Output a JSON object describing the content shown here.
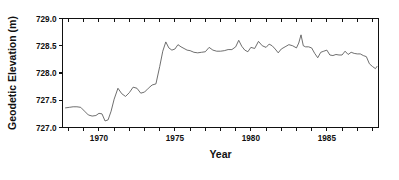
{
  "chart_data": {
    "type": "line",
    "title": "",
    "subtitle": "",
    "xlabel": "Year",
    "ylabel": "Geodetic Elevation (m)",
    "xlim": [
      1967.6,
      1988.4
    ],
    "ylim": [
      727.0,
      729.0
    ],
    "grid": false,
    "legend": null,
    "y_ticks": [
      {
        "value": 727.0,
        "label": "727.0"
      },
      {
        "value": 727.5,
        "label": "727.5"
      },
      {
        "value": 728.0,
        "label": "728.0"
      },
      {
        "value": 728.5,
        "label": "728.5"
      },
      {
        "value": 729.0,
        "label": "729.0"
      }
    ],
    "x_ticks_major": [
      {
        "value": 1970,
        "label": "1970"
      },
      {
        "value": 1975,
        "label": "1975"
      },
      {
        "value": 1980,
        "label": "1980"
      },
      {
        "value": 1985,
        "label": "1985"
      }
    ],
    "x_ticks_minor": [
      1968,
      1969,
      1971,
      1972,
      1973,
      1974,
      1976,
      1977,
      1978,
      1979,
      1981,
      1982,
      1983,
      1984,
      1986,
      1987,
      1988
    ],
    "line_color": "#555555",
    "axis_color": "#111111",
    "series": [
      {
        "name": "Geodetic Elevation",
        "x": [
          1967.8,
          1968.05,
          1968.3,
          1968.55,
          1968.8,
          1969.05,
          1969.3,
          1969.55,
          1969.8,
          1970.0,
          1970.2,
          1970.4,
          1970.6,
          1970.8,
          1971.0,
          1971.25,
          1971.5,
          1971.75,
          1972.0,
          1972.25,
          1972.5,
          1972.75,
          1973.0,
          1973.25,
          1973.5,
          1973.75,
          1974.0,
          1974.2,
          1974.4,
          1974.6,
          1974.8,
          1975.0,
          1975.2,
          1975.4,
          1975.6,
          1975.8,
          1976.0,
          1976.25,
          1976.5,
          1976.75,
          1977.0,
          1977.25,
          1977.5,
          1977.75,
          1978.0,
          1978.25,
          1978.5,
          1978.75,
          1979.0,
          1979.2,
          1979.4,
          1979.6,
          1979.8,
          1980.0,
          1980.25,
          1980.5,
          1980.75,
          1981.0,
          1981.2,
          1981.4,
          1981.6,
          1981.8,
          1982.0,
          1982.25,
          1982.5,
          1982.75,
          1983.0,
          1983.15,
          1983.3,
          1983.45,
          1983.6,
          1983.8,
          1984.0,
          1984.2,
          1984.4,
          1984.6,
          1984.8,
          1985.0,
          1985.2,
          1985.4,
          1985.6,
          1985.8,
          1986.0,
          1986.2,
          1986.4,
          1986.6,
          1986.8,
          1987.0,
          1987.2,
          1987.4,
          1987.6,
          1987.8,
          1988.0,
          1988.2,
          1988.3
        ],
        "y": [
          727.36,
          727.37,
          727.38,
          727.38,
          727.37,
          727.3,
          727.23,
          727.21,
          727.22,
          727.26,
          727.25,
          727.12,
          727.14,
          727.3,
          727.52,
          727.72,
          727.62,
          727.57,
          727.64,
          727.74,
          727.72,
          727.63,
          727.65,
          727.72,
          727.78,
          727.8,
          728.12,
          728.4,
          728.57,
          728.46,
          728.42,
          728.44,
          728.52,
          728.48,
          728.45,
          728.42,
          728.41,
          728.38,
          728.37,
          728.38,
          728.39,
          728.47,
          728.42,
          728.4,
          728.4,
          728.41,
          728.43,
          728.43,
          728.48,
          728.6,
          728.49,
          728.42,
          728.39,
          728.47,
          728.45,
          728.58,
          728.5,
          728.47,
          728.53,
          728.5,
          728.44,
          728.37,
          728.44,
          728.48,
          728.52,
          728.5,
          728.46,
          728.55,
          728.7,
          728.5,
          728.48,
          728.48,
          728.46,
          728.36,
          728.28,
          728.38,
          728.4,
          728.42,
          728.33,
          728.32,
          728.34,
          728.33,
          728.33,
          728.4,
          728.34,
          728.38,
          728.36,
          728.35,
          728.35,
          728.32,
          728.3,
          728.17,
          728.12,
          728.08,
          728.12
        ]
      }
    ]
  }
}
